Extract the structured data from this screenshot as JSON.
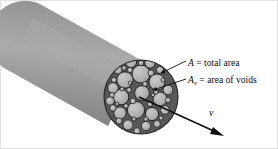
{
  "figure": {
    "name": "porous-pipe-cross-section",
    "canvas": {
      "width": 278,
      "height": 149,
      "background": "#ffffff"
    }
  },
  "labels": {
    "total_area": {
      "symbol": "A",
      "subscript": "",
      "equals": "=",
      "text": "total area",
      "full": "A = total area"
    },
    "void_area": {
      "symbol": "A",
      "subscript": "v",
      "equals": "=",
      "text": "area of voids",
      "full": "Av = area of voids"
    },
    "velocity": {
      "symbol": "v",
      "full": "v"
    }
  },
  "colors": {
    "cylinder_body": "#8f8f8f",
    "cylinder_body_light": "#a8a8a8",
    "cylinder_body_dark": "#6e6e6e",
    "particle_fill": "#b4b4b4",
    "particle_stroke": "#1a1a1a",
    "void_fill": "#4a4a4a",
    "leader_line": "#111111",
    "arrow": "#111111",
    "text": "#101010",
    "frame": "#d8d8d8"
  },
  "geometry": {
    "cylinder": {
      "axis_start": [
        38,
        40
      ],
      "axis_end": [
        141,
        97
      ],
      "radius": 37,
      "cap_rounded": true
    },
    "cross_section": {
      "center": [
        141,
        97
      ],
      "radius": 37,
      "particle_count": 44
    },
    "velocity_arrow": {
      "start": [
        139,
        97
      ],
      "end": [
        223,
        136
      ],
      "head_length": 11
    },
    "leader_total_area": {
      "from": [
        186,
        61
      ],
      "to": [
        160,
        73
      ]
    },
    "leader_void_area": {
      "from": [
        186,
        79
      ],
      "to": [
        152,
        90
      ]
    }
  },
  "chart_data": {
    "type": "diagram",
    "title": "",
    "annotations": [
      "A = total area",
      "Av = area of voids",
      "v"
    ],
    "particles": [
      {
        "cx": 141,
        "cy": 74,
        "r": 9.0
      },
      {
        "cx": 125,
        "cy": 80,
        "r": 8.2
      },
      {
        "cx": 157,
        "cy": 82,
        "r": 8.0
      },
      {
        "cx": 142,
        "cy": 93,
        "r": 7.4
      },
      {
        "cx": 121,
        "cy": 97,
        "r": 7.8
      },
      {
        "cx": 160,
        "cy": 99,
        "r": 7.0
      },
      {
        "cx": 136,
        "cy": 110,
        "r": 8.6
      },
      {
        "cx": 152,
        "cy": 114,
        "r": 6.6
      },
      {
        "cx": 120,
        "cy": 113,
        "r": 6.2
      },
      {
        "cx": 131,
        "cy": 62,
        "r": 5.6
      },
      {
        "cx": 150,
        "cy": 63,
        "r": 5.2
      },
      {
        "cx": 113,
        "cy": 88,
        "r": 5.4
      },
      {
        "cx": 168,
        "cy": 90,
        "r": 4.8
      },
      {
        "cx": 128,
        "cy": 125,
        "r": 5.0
      },
      {
        "cx": 146,
        "cy": 126,
        "r": 4.6
      },
      {
        "cx": 110,
        "cy": 101,
        "r": 4.2
      },
      {
        "cx": 165,
        "cy": 110,
        "r": 4.4
      },
      {
        "cx": 118,
        "cy": 70,
        "r": 4.0
      },
      {
        "cx": 160,
        "cy": 70,
        "r": 3.6
      },
      {
        "cx": 113,
        "cy": 108,
        "r": 3.2
      },
      {
        "cx": 157,
        "cy": 124,
        "r": 3.4
      },
      {
        "cx": 137,
        "cy": 131,
        "r": 3.2
      },
      {
        "cx": 119,
        "cy": 121,
        "r": 3.0
      },
      {
        "cx": 151,
        "cy": 73,
        "r": 3.0
      },
      {
        "cx": 130,
        "cy": 70,
        "r": 2.6
      },
      {
        "cx": 133,
        "cy": 101,
        "r": 2.8
      },
      {
        "cx": 150,
        "cy": 104,
        "r": 2.6
      },
      {
        "cx": 129,
        "cy": 90,
        "r": 2.4
      },
      {
        "cx": 168,
        "cy": 100,
        "r": 2.6
      },
      {
        "cx": 112,
        "cy": 95,
        "r": 2.4
      },
      {
        "cx": 145,
        "cy": 84,
        "r": 2.4
      },
      {
        "cx": 114,
        "cy": 80,
        "r": 2.6
      },
      {
        "cx": 124,
        "cy": 68,
        "r": 2.2
      },
      {
        "cx": 141,
        "cy": 63,
        "r": 2.6
      },
      {
        "cx": 156,
        "cy": 92,
        "r": 2.2
      },
      {
        "cx": 126,
        "cy": 106,
        "r": 2.2
      },
      {
        "cx": 146,
        "cy": 119,
        "r": 2.2
      },
      {
        "cx": 161,
        "cy": 118,
        "r": 2.0
      },
      {
        "cx": 122,
        "cy": 89,
        "r": 2.0
      },
      {
        "cx": 134,
        "cy": 119,
        "r": 2.0
      },
      {
        "cx": 117,
        "cy": 104,
        "r": 1.8
      },
      {
        "cx": 163,
        "cy": 80,
        "r": 2.0
      },
      {
        "cx": 153,
        "cy": 95,
        "r": 1.8
      },
      {
        "cx": 130,
        "cy": 83,
        "r": 1.8
      }
    ]
  }
}
